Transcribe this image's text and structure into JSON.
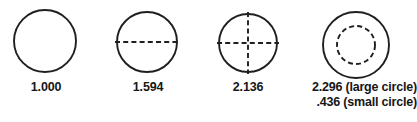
{
  "figure": {
    "background_color": "#ffffff",
    "stroke_color": "#1f1f1f",
    "label_color": "#161616"
  },
  "items": [
    {
      "id": "circle-plain",
      "label": "1.000",
      "annotation": "none",
      "outer_diameter_px": 63
    },
    {
      "id": "circle-horizontal-dashed-diameter",
      "label": "1.594",
      "annotation": "horizontal-dashed-diameter",
      "outer_diameter_px": 61
    },
    {
      "id": "circle-crosshair-dashed",
      "label": "2.136",
      "annotation": "crosshair-dashed",
      "outer_diameter_px": 59
    },
    {
      "id": "circle-concentric-dashed",
      "label_large": "2.296 (large circle)",
      "label_small": ".436 (small circle)",
      "annotation": "inner-dashed-circle",
      "outer_diameter_px": 68,
      "inner_diameter_px": 38
    }
  ]
}
